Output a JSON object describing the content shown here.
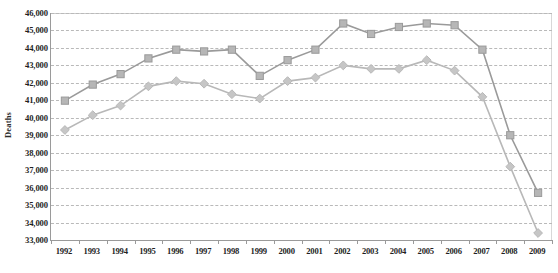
{
  "chart_data": {
    "type": "line",
    "title": "",
    "xlabel": "",
    "ylabel": "Deaths",
    "ylim": [
      33000,
      46000
    ],
    "ytick_step": 1000,
    "grid": true,
    "legend": "none",
    "categories": [
      "1992",
      "1993",
      "1994",
      "1995",
      "1996",
      "1997",
      "1998",
      "1999",
      "2000",
      "2001",
      "2002",
      "2003",
      "2004",
      "2005",
      "2006",
      "2007",
      "2008",
      "2009"
    ],
    "ytick_labels": [
      "46,000",
      "45,000",
      "44,000",
      "43,000",
      "42,000",
      "41,000",
      "40,000",
      "39,000",
      "38,000",
      "37,000",
      "36,000",
      "35,000",
      "34,000",
      "33,000"
    ],
    "series": [
      {
        "name": "Upper series",
        "marker": "square",
        "color": "#9a9a9a",
        "fill": "#b6b6b6",
        "values": [
          40980,
          41900,
          42500,
          43400,
          43900,
          43800,
          43900,
          42400,
          43300,
          43900,
          45400,
          44800,
          45200,
          45400,
          45300,
          43900,
          39000,
          35700
        ]
      },
      {
        "name": "Lower series",
        "marker": "diamond",
        "color": "#b8b8b8",
        "fill": "#c6c6c6",
        "values": [
          39300,
          40150,
          40700,
          41800,
          42100,
          41950,
          41350,
          41100,
          42100,
          42300,
          43000,
          42800,
          42800,
          43300,
          42700,
          41200,
          37200,
          33400
        ]
      }
    ]
  },
  "axis": {
    "y_title": "Deaths"
  },
  "colors": {
    "grid": "#b9b9b9",
    "axis": "#9a9a9a",
    "text": "#1f1f1f",
    "series_upper": "#9a9a9a",
    "series_lower": "#c0c0c0"
  }
}
